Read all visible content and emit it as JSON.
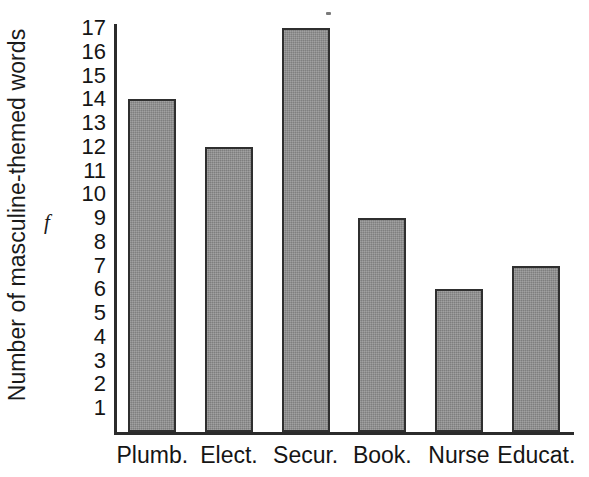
{
  "chart_data": {
    "type": "bar",
    "title": "",
    "subtitle": "",
    "xlabel": "",
    "ylabel": "Number of masculine-themed words",
    "frequency_symbol": "f",
    "categories": [
      "Plumb.",
      "Elect.",
      "Secur.",
      "Book.",
      "Nurse",
      "Educat."
    ],
    "values": [
      14,
      12,
      17,
      9,
      6,
      7
    ],
    "ylim": [
      0,
      17.5
    ],
    "ytick_labels": [
      "17",
      "16",
      "15",
      "14",
      "13",
      "12",
      "11",
      "10",
      "9",
      "8",
      "7",
      "6",
      "5",
      "4",
      "3",
      "2",
      "1"
    ],
    "ytick_values": [
      17,
      16,
      15,
      14,
      13,
      12,
      11,
      10,
      9,
      8,
      7,
      6,
      5,
      4,
      3,
      2,
      1
    ],
    "grid": false,
    "legend": null,
    "legend_position": "none",
    "bar_fill_color": "#8a8a8a",
    "bar_edge_color": "#2f2f2f",
    "axis_color": "#2b2b2b",
    "background_color": "#ffffff",
    "text_color": "#151515"
  }
}
